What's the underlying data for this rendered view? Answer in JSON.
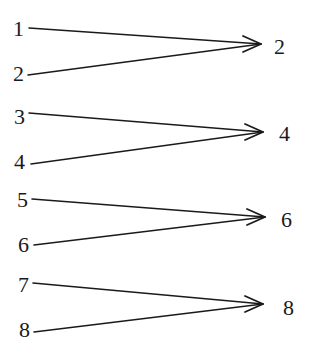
{
  "diagram": {
    "type": "mapping",
    "colors": {
      "ink": "#1a1a1a",
      "background": "#ffffff"
    },
    "groups": [
      {
        "sources": [
          {
            "label": "1",
            "x": 13,
            "y": 36,
            "line_start": [
              29,
              28
            ]
          },
          {
            "label": "2",
            "x": 13,
            "y": 81,
            "line_start": [
              28,
              75
            ]
          }
        ],
        "tip": [
          261,
          44
        ],
        "target": {
          "label": "2",
          "x": 274,
          "y": 54
        }
      },
      {
        "sources": [
          {
            "label": "3",
            "x": 14,
            "y": 124,
            "line_start": [
              29,
              113
            ]
          },
          {
            "label": "4",
            "x": 14,
            "y": 169,
            "line_start": [
              31,
              164
            ]
          }
        ],
        "tip": [
          263,
          132
        ],
        "target": {
          "label": "4",
          "x": 279,
          "y": 141
        }
      },
      {
        "sources": [
          {
            "label": "5",
            "x": 17,
            "y": 207,
            "line_start": [
              32,
              199
            ]
          },
          {
            "label": "6",
            "x": 18,
            "y": 252,
            "line_start": [
              34,
              245
            ]
          }
        ],
        "tip": [
          265,
          217
        ],
        "target": {
          "label": "6",
          "x": 281,
          "y": 227
        }
      },
      {
        "sources": [
          {
            "label": "7",
            "x": 18,
            "y": 292,
            "line_start": [
              33,
              283
            ]
          },
          {
            "label": "8",
            "x": 19,
            "y": 337,
            "line_start": [
              34,
              332
            ]
          }
        ],
        "tip": [
          263,
          304
        ],
        "target": {
          "label": "8",
          "x": 283,
          "y": 315
        }
      }
    ]
  }
}
